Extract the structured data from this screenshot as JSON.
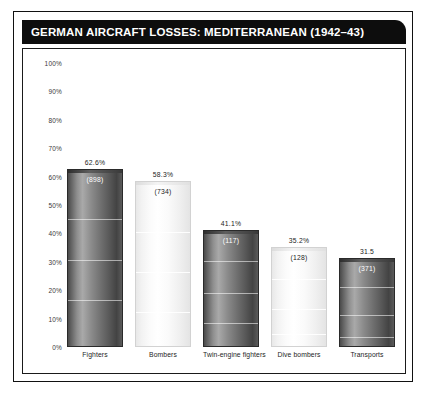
{
  "title": "GERMAN AIRCRAFT LOSSES: MEDITERRANEAN (1942–43)",
  "chart_data": {
    "type": "bar",
    "title": "GERMAN AIRCRAFT LOSSES: MEDITERRANEAN (1942–43)",
    "xlabel": "",
    "ylabel": "",
    "ylim": [
      0,
      100
    ],
    "grid": false,
    "legend": null,
    "ytick_labels": [
      "100%",
      "90%",
      "80%",
      "70%",
      "60%",
      "50%",
      "40%",
      "30%",
      "20%",
      "10%",
      "0%"
    ],
    "ytick_values": [
      100,
      90,
      80,
      70,
      60,
      50,
      40,
      30,
      20,
      10,
      0
    ],
    "categories": [
      "Fighters",
      "Bombers",
      "Twin-engine fighters",
      "Dive bombers",
      "Transports"
    ],
    "values": [
      62.6,
      58.3,
      41.1,
      35.2,
      31.5
    ],
    "value_labels": [
      "62.6%",
      "58.3%",
      "41.1%",
      "35.2%",
      "31.5"
    ],
    "count_labels": [
      "(898)",
      "(734)",
      "(117)",
      "(128)",
      "(371)"
    ],
    "counts": [
      898,
      734,
      117,
      128,
      371
    ],
    "bar_styles": [
      "dark",
      "light",
      "dark",
      "light",
      "dark"
    ]
  },
  "colors": {
    "title_bar_background": "#0d0d0d",
    "title_text": "#ffffff",
    "panel_background": "#ffffff",
    "panel_border": "#111111",
    "axis_text": "#3a3a3a",
    "label_text": "#1d1d1d"
  }
}
